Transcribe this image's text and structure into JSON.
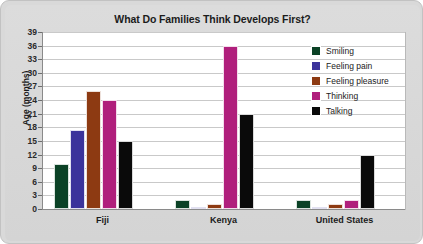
{
  "chart_data": {
    "type": "bar",
    "title": "What Do Families Think Develops First?",
    "xlabel": "",
    "ylabel": "Age (months)",
    "ylim": [
      0,
      39
    ],
    "ytick_step": 3,
    "yticks": [
      0,
      3,
      6,
      9,
      12,
      15,
      18,
      21,
      24,
      27,
      30,
      33,
      36,
      39
    ],
    "categories": [
      "Fiji",
      "Kenya",
      "United States"
    ],
    "grid": true,
    "legend_position": "top-right",
    "series": [
      {
        "name": "Smiling",
        "color": "#0b4226",
        "values": [
          10,
          2,
          2
        ]
      },
      {
        "name": "Feeling pain",
        "color": "#3b339b",
        "values": [
          17.5,
          0.5,
          0.3
        ]
      },
      {
        "name": "Feeling pleasure",
        "color": "#8d3a12",
        "values": [
          26,
          1,
          1
        ]
      },
      {
        "name": "Thinking",
        "color": "#b01f7c",
        "values": [
          24,
          36,
          2
        ]
      },
      {
        "name": "Talking",
        "color": "#0a0a0a",
        "values": [
          15,
          21,
          12
        ]
      }
    ]
  },
  "legend": {
    "items": [
      {
        "label": "Smiling"
      },
      {
        "label": "Feeling pain"
      },
      {
        "label": "Feeling pleasure"
      },
      {
        "label": "Thinking"
      },
      {
        "label": "Talking"
      }
    ]
  }
}
